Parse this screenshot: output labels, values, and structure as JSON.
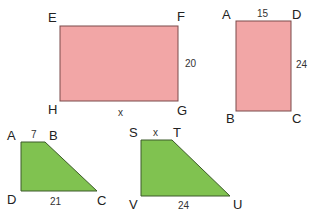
{
  "colors": {
    "rect_fill": "#f2a6a6",
    "rect_stroke": "#7a4a4a",
    "trap_fill": "#80c250",
    "trap_stroke": "#3d5a2a"
  },
  "figures": [
    {
      "name": "rectangle-EFGH",
      "vertices": [
        "E",
        "F",
        "G",
        "H"
      ],
      "side_labels": {
        "FG": "20",
        "HG": "x"
      }
    },
    {
      "name": "rectangle-ABCD",
      "vertices": [
        "A",
        "D",
        "C",
        "B"
      ],
      "side_labels": {
        "AD": "15",
        "DC": "24"
      }
    },
    {
      "name": "trapezoid-ABCD",
      "vertices": [
        "A",
        "B",
        "C",
        "D"
      ],
      "side_labels": {
        "AB": "7",
        "DC": "21"
      }
    },
    {
      "name": "trapezoid-STUV",
      "vertices": [
        "S",
        "T",
        "U",
        "V"
      ],
      "side_labels": {
        "ST": "x",
        "VU": "24"
      }
    }
  ],
  "labels": {
    "r1": {
      "E": "E",
      "F": "F",
      "G": "G",
      "H": "H",
      "side": "20",
      "bottom": "x"
    },
    "r2": {
      "A": "A",
      "D": "D",
      "B": "B",
      "C": "C",
      "top": "15",
      "side": "24"
    },
    "t1": {
      "A": "A",
      "B": "B",
      "C": "C",
      "D": "D",
      "top": "7",
      "bottom": "21"
    },
    "t2": {
      "S": "S",
      "T": "T",
      "U": "U",
      "V": "V",
      "top": "x",
      "bottom": "24"
    }
  }
}
